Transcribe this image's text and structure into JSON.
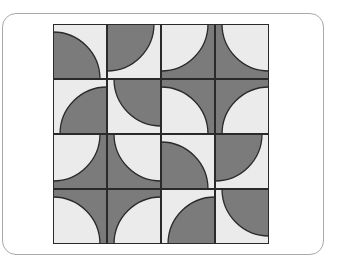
{
  "figure": {
    "colors": {
      "dark": "#7b7b7b",
      "light": "#ebebeb",
      "stroke": "#2a2a2a",
      "frame": "#a8a8a8"
    },
    "grid": {
      "rows": 4,
      "cols": 4
    },
    "tiles": [
      [
        {
          "disk": "dark",
          "corner": "bl"
        },
        {
          "disk": "dark",
          "corner": "tl"
        },
        {
          "disk": "light",
          "corner": "tl"
        },
        {
          "disk": "light",
          "corner": "tr"
        }
      ],
      [
        {
          "disk": "dark",
          "corner": "br"
        },
        {
          "disk": "dark",
          "corner": "tr"
        },
        {
          "disk": "light",
          "corner": "bl"
        },
        {
          "disk": "light",
          "corner": "br"
        }
      ],
      [
        {
          "disk": "light",
          "corner": "tl"
        },
        {
          "disk": "light",
          "corner": "tr"
        },
        {
          "disk": "dark",
          "corner": "bl"
        },
        {
          "disk": "dark",
          "corner": "tl"
        }
      ],
      [
        {
          "disk": "light",
          "corner": "bl"
        },
        {
          "disk": "light",
          "corner": "br"
        },
        {
          "disk": "dark",
          "corner": "br"
        },
        {
          "disk": "dark",
          "corner": "tr"
        }
      ]
    ]
  }
}
